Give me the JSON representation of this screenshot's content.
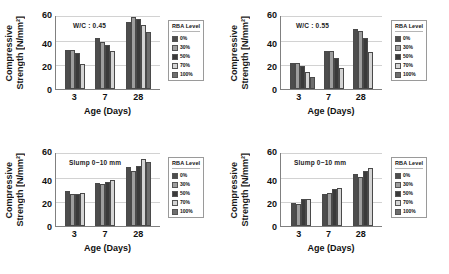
{
  "figure": {
    "legend_title": "RBA Level",
    "y_title_line1": "Compressive",
    "y_title_line2": "Strength [N/mm²]",
    "x_title": "Age (Days)",
    "y_ticks": [
      "60",
      "40",
      "20",
      "0"
    ],
    "categories": [
      "3",
      "7",
      "28"
    ],
    "series_colors": [
      "#4d4d4d",
      "#9e9e9e",
      "#3a3a3a",
      "#d4d4d4",
      "#6e6e6e"
    ],
    "series_names": [
      "0%",
      "30%",
      "50%",
      "70%",
      "100%"
    ]
  },
  "chart_data": [
    {
      "type": "bar",
      "panel": "top-left",
      "title": "",
      "annotation": "W/C : 0.45",
      "xlabel": "Age (Days)",
      "ylabel": "Compressive Strength [N/mm²]",
      "ylim": [
        0,
        60
      ],
      "yticks": [
        0,
        20,
        40,
        60
      ],
      "grid": true,
      "legend_position": "right",
      "legend_title": "RBA Level",
      "categories": [
        "3",
        "7",
        "28"
      ],
      "series": [
        {
          "name": "0%",
          "values": [
            32,
            41,
            54
          ]
        },
        {
          "name": "30%",
          "values": [
            32,
            38,
            58
          ]
        },
        {
          "name": "50%",
          "values": [
            29,
            36,
            57
          ]
        },
        {
          "name": "70%",
          "values": [
            20,
            31,
            52
          ]
        },
        {
          "name": "100%",
          "values": [
            null,
            null,
            46
          ]
        }
      ]
    },
    {
      "type": "bar",
      "panel": "top-right",
      "title": "",
      "annotation": "W/C : 0.55",
      "xlabel": "Age (Days)",
      "ylabel": "Compressive Strength [N/mm²]",
      "ylim": [
        0,
        60
      ],
      "yticks": [
        0,
        20,
        40,
        60
      ],
      "grid": true,
      "legend_position": "right",
      "legend_title": "RBA Level",
      "categories": [
        "3",
        "7",
        "28"
      ],
      "series": [
        {
          "name": "0%",
          "values": [
            21,
            31,
            49
          ]
        },
        {
          "name": "30%",
          "values": [
            21,
            31,
            47
          ]
        },
        {
          "name": "50%",
          "values": [
            19,
            25,
            41
          ]
        },
        {
          "name": "70%",
          "values": [
            14,
            17,
            30
          ]
        },
        {
          "name": "100%",
          "values": [
            10,
            null,
            null
          ]
        }
      ]
    },
    {
      "type": "bar",
      "panel": "bottom-left",
      "title": "",
      "annotation": "Slump 0~10 mm",
      "xlabel": "Age (Days)",
      "ylabel": "Compressive Strength [N/mm²]",
      "ylim": [
        0,
        60
      ],
      "yticks": [
        0,
        20,
        40,
        60
      ],
      "grid": true,
      "legend_position": "right",
      "legend_title": "RBA Level",
      "categories": [
        "3",
        "7",
        "28"
      ],
      "series": [
        {
          "name": "0%",
          "values": [
            28,
            35,
            48
          ]
        },
        {
          "name": "30%",
          "values": [
            26,
            34,
            45
          ]
        },
        {
          "name": "50%",
          "values": [
            26,
            36,
            49
          ]
        },
        {
          "name": "70%",
          "values": [
            27,
            37,
            54
          ]
        },
        {
          "name": "100%",
          "values": [
            null,
            null,
            52
          ]
        }
      ]
    },
    {
      "type": "bar",
      "panel": "bottom-right",
      "title": "",
      "annotation": "Slump 0~10 mm",
      "xlabel": "Age (Days)",
      "ylabel": "Compressive Strength [N/mm²]",
      "ylim": [
        0,
        60
      ],
      "yticks": [
        0,
        20,
        40,
        60
      ],
      "grid": true,
      "legend_position": "right",
      "legend_title": "RBA Level",
      "categories": [
        "3",
        "7",
        "28"
      ],
      "series": [
        {
          "name": "0%",
          "values": [
            19,
            26,
            42
          ]
        },
        {
          "name": "30%",
          "values": [
            18,
            27,
            40
          ]
        },
        {
          "name": "50%",
          "values": [
            22,
            30,
            45
          ]
        },
        {
          "name": "70%",
          "values": [
            22,
            31,
            47
          ]
        },
        {
          "name": "100%",
          "values": [
            null,
            null,
            null
          ]
        }
      ]
    }
  ]
}
